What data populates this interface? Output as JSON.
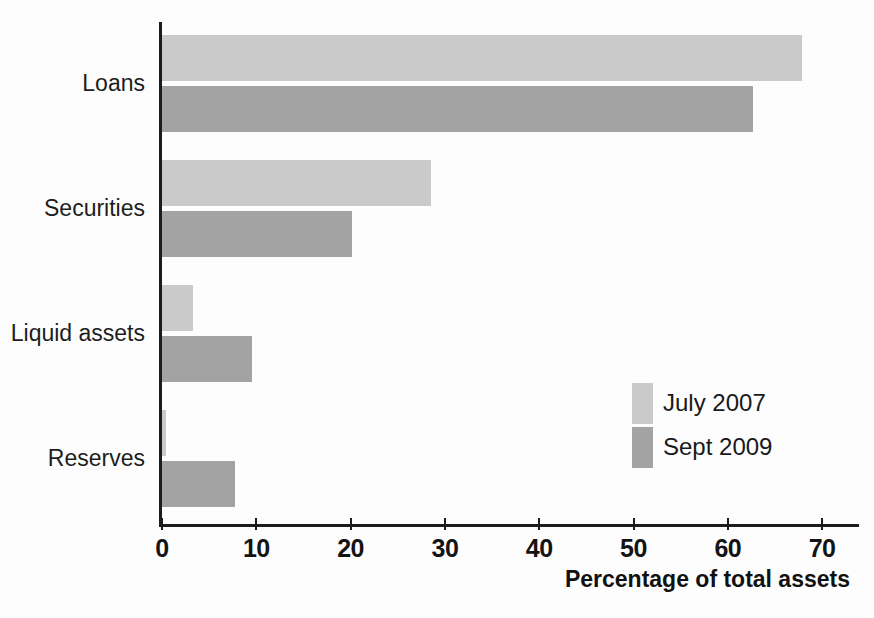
{
  "chart_data": {
    "type": "bar",
    "orientation": "horizontal",
    "title": "",
    "xlabel": "Percentage of total assets",
    "ylabel": "",
    "categories": [
      "Loans",
      "Securities",
      "Liquid assets",
      "Reserves"
    ],
    "series": [
      {
        "name": "July 2007",
        "color": "#cacaca",
        "values": [
          67.9,
          28.5,
          3.3,
          0.4
        ]
      },
      {
        "name": "Sept 2009",
        "color": "#a3a3a3",
        "values": [
          62.7,
          20.1,
          9.5,
          7.7
        ]
      }
    ],
    "xlim": [
      0,
      70
    ],
    "xticks": [
      0,
      10,
      20,
      30,
      40,
      50,
      60,
      70
    ],
    "xtick_labels": [
      "0",
      "10",
      "20",
      "30",
      "40",
      "50",
      "60",
      "70"
    ],
    "grid": false,
    "legend_position": "inside-right"
  },
  "legend": {
    "entries": [
      {
        "label": "July 2007"
      },
      {
        "label": "Sept 2009"
      }
    ]
  },
  "axis": {
    "x_title": "Percentage of total assets"
  }
}
